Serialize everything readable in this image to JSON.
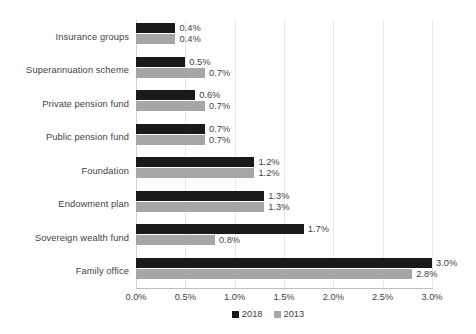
{
  "chart_data": {
    "type": "bar",
    "orientation": "horizontal",
    "title": "",
    "xlabel": "",
    "ylabel": "",
    "xlim": [
      0,
      3.0
    ],
    "xtick_labels": [
      "0.0%",
      "0.5%",
      "1.0%",
      "1.5%",
      "2.0%",
      "2.5%",
      "3.0%"
    ],
    "xtick_values": [
      0,
      0.5,
      1.0,
      1.5,
      2.0,
      2.5,
      3.0
    ],
    "grid": true,
    "grid_axis": "x",
    "legend_position": "bottom",
    "categories": [
      "Insurance groups",
      "Superannuation scheme",
      "Private pension fund",
      "Public pension fund",
      "Foundation",
      "Endowment plan",
      "Sovereign wealth fund",
      "Family office"
    ],
    "series": [
      {
        "name": "2018",
        "color": "#1a1a1a",
        "values": [
          0.4,
          0.5,
          0.6,
          0.7,
          1.2,
          1.3,
          1.7,
          3.0
        ],
        "labels": [
          "0.4%",
          "0.5%",
          "0.6%",
          "0.7%",
          "1.2%",
          "1.3%",
          "1.7%",
          "3.0%"
        ]
      },
      {
        "name": "2013",
        "color": "#a6a6a6",
        "values": [
          0.4,
          0.7,
          0.7,
          0.7,
          1.2,
          1.3,
          0.8,
          2.8
        ],
        "labels": [
          "0.4%",
          "0.7%",
          "0.7%",
          "0.7%",
          "1.2%",
          "1.3%",
          "0.8%",
          "2.8%"
        ]
      }
    ]
  }
}
